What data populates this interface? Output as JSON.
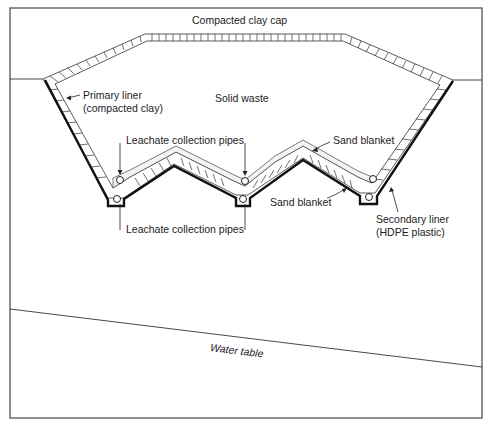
{
  "figure": {
    "type": "landfill-cross-section",
    "labels": {
      "cap": "Compacted clay cap",
      "waste": "Solid waste",
      "primary_liner_line1": "Primary liner",
      "primary_liner_line2": "(compacted clay)",
      "pipes_upper": "Leachate collection pipes",
      "pipes_lower": "Leachate collection pipes",
      "sand_upper": "Sand blanket",
      "sand_lower": "Sand blanket",
      "secondary_liner_line1": "Secondary liner",
      "secondary_liner_line2": "(HDPE plastic)",
      "water_table": "Water table"
    }
  }
}
